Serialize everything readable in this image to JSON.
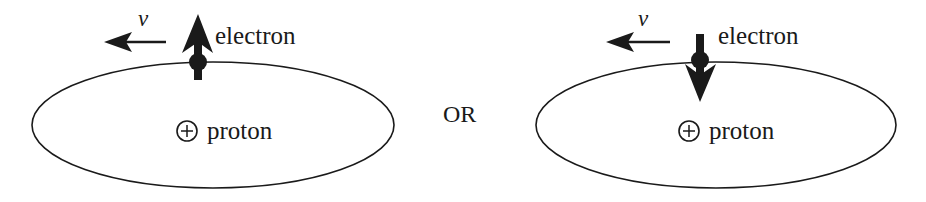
{
  "diagram": {
    "separator_label": "OR",
    "panels": [
      {
        "id": "spin-up",
        "velocity_label": "v",
        "electron_label": "electron",
        "proton_label": "proton",
        "proton_symbol": "+",
        "spin_direction": "up"
      },
      {
        "id": "spin-down",
        "velocity_label": "v",
        "electron_label": "electron",
        "proton_label": "proton",
        "proton_symbol": "+",
        "spin_direction": "down"
      }
    ],
    "colors": {
      "ink": "#1a1a1a",
      "background": "#ffffff"
    }
  }
}
